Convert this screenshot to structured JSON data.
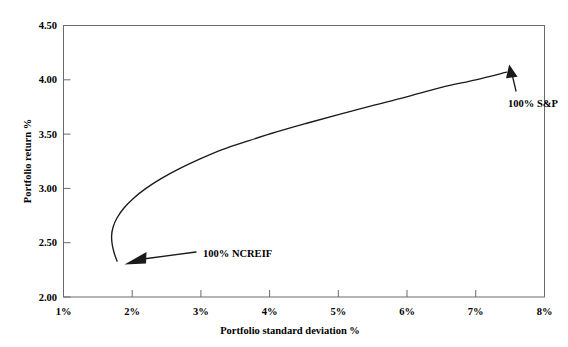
{
  "chart_data": {
    "type": "line",
    "title": "",
    "subtitle": "",
    "xlabel": "Portfolio standard deviation %",
    "ylabel": "Portfolio return %",
    "xlim": [
      1,
      8
    ],
    "ylim": [
      2.0,
      4.5
    ],
    "xticks": [
      "1%",
      "2%",
      "3%",
      "4%",
      "5%",
      "6%",
      "7%",
      "8%"
    ],
    "xtick_values": [
      1,
      2,
      3,
      4,
      5,
      6,
      7,
      8
    ],
    "yticks": [
      "2.00",
      "2.50",
      "3.00",
      "3.50",
      "4.00",
      "4.50"
    ],
    "ytick_values": [
      2.0,
      2.5,
      3.0,
      3.5,
      4.0,
      4.5
    ],
    "grid": false,
    "legend": "none",
    "series": [
      {
        "name": "Efficient frontier",
        "x": [
          1.78,
          1.74,
          1.71,
          1.7,
          1.72,
          1.78,
          1.88,
          2.02,
          2.2,
          2.42,
          2.68,
          2.98,
          3.32,
          3.7,
          4.1,
          4.54,
          5.0,
          5.48,
          5.98,
          6.5,
          7.0,
          7.45
        ],
        "y": [
          2.33,
          2.4,
          2.48,
          2.56,
          2.64,
          2.73,
          2.82,
          2.91,
          3.0,
          3.09,
          3.18,
          3.27,
          3.36,
          3.44,
          3.52,
          3.6,
          3.68,
          3.76,
          3.84,
          3.93,
          4.0,
          4.07
        ]
      }
    ],
    "annotations": [
      {
        "name": "100% S&P",
        "label": "100% S&P",
        "point_x": 7.45,
        "point_y": 4.07,
        "text_x": 7.38,
        "text_y": 3.66
      },
      {
        "name": "100% NCREIF",
        "label": "100% NCREIF",
        "point_x": 1.78,
        "point_y": 2.33,
        "text_x": 2.95,
        "text_y": 2.43
      }
    ],
    "colors": {
      "curve": "#1a1a1a",
      "frame": "#6a6a6a",
      "text": "#000000",
      "background": "#ffffff"
    }
  }
}
